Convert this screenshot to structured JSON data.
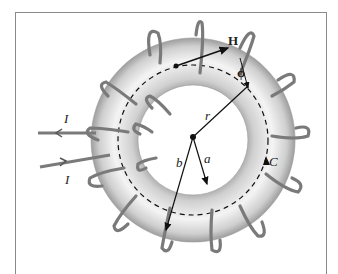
{
  "figure": {
    "labels": {
      "H": "H",
      "phi": "ϕ",
      "r": "r",
      "a": "a",
      "b": "b",
      "C": "C",
      "I_top": "I",
      "I_bottom": "I"
    },
    "colors": {
      "torus_outer": "#bdbdbd",
      "torus_light": "#f2f2f2",
      "winding": "#7a7a7a",
      "frame": "#8a8a8a"
    }
  }
}
